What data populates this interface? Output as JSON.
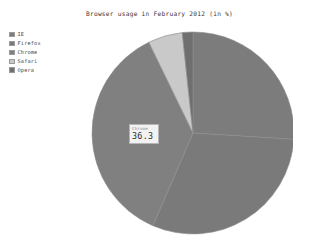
{
  "chart_data": {
    "type": "pie",
    "title": "Browser usage in February 2012 (in %)",
    "xlabel": "",
    "ylabel": "",
    "legend_position": "top-left",
    "grid": false,
    "categories": [
      "IE",
      "Firefox",
      "Chrome",
      "Safari",
      "Opera"
    ],
    "values": [
      26.0,
      30.5,
      36.3,
      5.5,
      1.7
    ],
    "colors": [
      "#7c7c7c",
      "#7a7a7a",
      "#808080",
      "#c9c9c9",
      "#6f6f6f"
    ],
    "start_angle_deg": 0,
    "direction": "clockwise",
    "annotations": [
      {
        "series": "Chrome",
        "label": "Chrome",
        "value": "36.3"
      }
    ]
  },
  "legend": {
    "items": [
      {
        "label": "IE",
        "color": "#7c7c7c"
      },
      {
        "label": "Firefox",
        "color": "#7a7a7a"
      },
      {
        "label": "Chrome",
        "color": "#808080"
      },
      {
        "label": "Safari",
        "color": "#c9c9c9"
      },
      {
        "label": "Opera",
        "color": "#6f6f6f"
      }
    ]
  },
  "callout": {
    "name": "Chrome",
    "value": "36.3"
  }
}
